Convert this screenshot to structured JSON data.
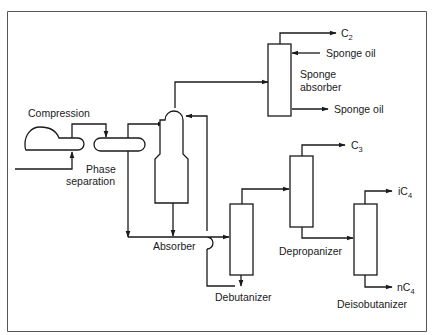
{
  "diagram": {
    "type": "process-flow",
    "title": "",
    "frame_color": "#555555",
    "line_color": "#1a1a1a",
    "units": [
      {
        "id": "compressor",
        "label": "Compression"
      },
      {
        "id": "phase-separator",
        "label_line1": "Phase",
        "label_line2": "separation"
      },
      {
        "id": "absorber",
        "label": "Absorber"
      },
      {
        "id": "sponge-absorber",
        "label_line1": "Sponge",
        "label_line2": "absorber"
      },
      {
        "id": "debutanizer",
        "label": "Debutanizer"
      },
      {
        "id": "depropanizer",
        "label": "Depropanizer"
      },
      {
        "id": "deisobutanizer",
        "label": "Deisobutanizer"
      }
    ],
    "streams": {
      "c2": {
        "main": "C",
        "sub": "2"
      },
      "sponge_oil_in": "Sponge oil",
      "sponge_oil_out": "Sponge oil",
      "c3": {
        "main": "C",
        "sub": "3"
      },
      "ic4": {
        "main": "iC",
        "sub": "4"
      },
      "nc4": {
        "main": "nC",
        "sub": "4"
      }
    },
    "connections": [
      {
        "from": "feed",
        "to": "compressor"
      },
      {
        "from": "compressor",
        "to": "phase-separator"
      },
      {
        "from": "phase-separator",
        "to": "absorber",
        "phase": "vapor"
      },
      {
        "from": "phase-separator",
        "to": "debutanizer",
        "phase": "liquid"
      },
      {
        "from": "absorber",
        "to": "sponge-absorber",
        "phase": "overhead"
      },
      {
        "from": "absorber",
        "to": "debutanizer",
        "phase": "bottoms"
      },
      {
        "from": "debutanizer",
        "to": "absorber",
        "phase": "bottoms recycle"
      },
      {
        "from": "sponge-absorber",
        "to": "C2"
      },
      {
        "from": "Sponge oil",
        "to": "sponge-absorber"
      },
      {
        "from": "sponge-absorber",
        "to": "Sponge oil"
      },
      {
        "from": "debutanizer",
        "to": "depropanizer",
        "phase": "overhead"
      },
      {
        "from": "depropanizer",
        "to": "C3"
      },
      {
        "from": "depropanizer",
        "to": "deisobutanizer",
        "phase": "bottoms"
      },
      {
        "from": "deisobutanizer",
        "to": "iC4"
      },
      {
        "from": "deisobutanizer",
        "to": "nC4"
      }
    ]
  }
}
